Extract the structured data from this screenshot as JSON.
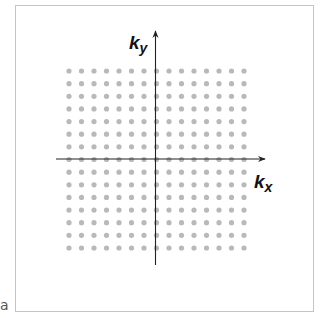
{
  "panel_label": "a",
  "axes": {
    "x_label": {
      "main": "k",
      "sub": "x"
    },
    "y_label": {
      "main": "k",
      "sub": "y"
    }
  },
  "grid": {
    "columns": 15,
    "rows": 15,
    "dot_color": "#b9b9b9",
    "origin_column_index": 7,
    "origin_row_index": 7
  },
  "colors": {
    "axis": "#222222",
    "frame": "#c4c4c4"
  }
}
